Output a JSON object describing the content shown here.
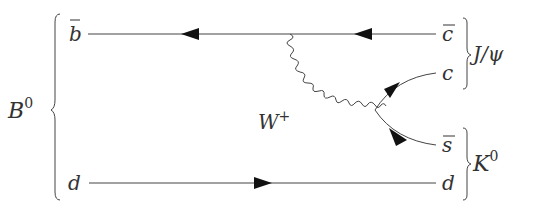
{
  "diagram": {
    "type": "feynman",
    "particles": {
      "initial_meson": "B",
      "initial_meson_sup": "0",
      "b_bar": "b",
      "d_left": "d",
      "c_bar": "c",
      "c": "c",
      "s_bar": "s",
      "d_right": "d",
      "w_boson": "W",
      "w_sup": "+",
      "jpsi": "J/ψ",
      "kaon": "K",
      "kaon_sup": "0"
    }
  }
}
